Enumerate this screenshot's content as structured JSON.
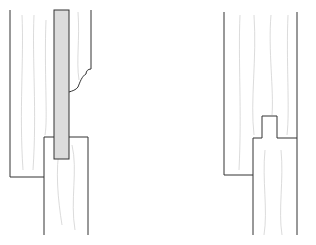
{
  "diagram": {
    "figures": [
      {
        "name": "panel-groove-joint",
        "parts": [
          "stile",
          "panel",
          "moulded-edge",
          "rail"
        ]
      },
      {
        "name": "tongue-groove-joint",
        "parts": [
          "upper-board",
          "tongue",
          "lower-board"
        ]
      }
    ],
    "colors": {
      "line": "#333333",
      "grain": "#c8c8c8",
      "panel": "#d9d9d9"
    }
  }
}
